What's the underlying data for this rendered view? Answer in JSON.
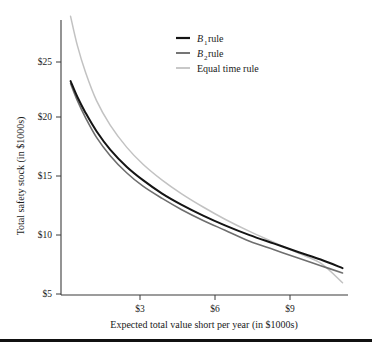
{
  "chart_data": {
    "type": "line",
    "title": "",
    "xlabel": "Expected total value short per year (in $1000s)",
    "ylabel": "Total safety stock (in $1000s)",
    "xlim": [
      1.0,
      11.5
    ],
    "ylim": [
      5,
      27.5
    ],
    "xticks": [
      3,
      6,
      9
    ],
    "xtick_labels": [
      "$3",
      "$6",
      "$9"
    ],
    "yticks": [
      5,
      10,
      15,
      20,
      25
    ],
    "ytick_labels": [
      "$5",
      "$10",
      "$15",
      "$20",
      "$25"
    ],
    "grid": false,
    "legend_position": "top-center-right",
    "series": [
      {
        "name": "B1 rule",
        "label_main": "B",
        "label_sub": "1",
        "label_tail": " rule",
        "color": "#141414",
        "width": 2.0,
        "x": [
          1.35,
          1.6,
          1.9,
          2.3,
          2.8,
          3.4,
          4.0,
          4.7,
          5.4,
          6.2,
          7.0,
          7.9,
          8.8,
          9.7,
          10.5,
          11.3
        ],
        "y": [
          22.5,
          21.2,
          19.9,
          18.4,
          16.9,
          15.5,
          14.4,
          13.3,
          12.4,
          11.5,
          10.7,
          9.9,
          9.2,
          8.5,
          7.9,
          7.2
        ]
      },
      {
        "name": "B2 rule",
        "label_main": "B",
        "label_sub": "2",
        "label_tail": " rule",
        "color": "#6e6e6e",
        "width": 1.6,
        "x": [
          1.35,
          1.6,
          1.9,
          2.3,
          2.8,
          3.4,
          4.0,
          4.7,
          5.4,
          6.2,
          7.0,
          7.9,
          8.8,
          9.7,
          10.5,
          11.3
        ],
        "y": [
          22.3,
          20.9,
          19.5,
          17.9,
          16.4,
          15.0,
          13.9,
          12.9,
          12.0,
          11.1,
          10.3,
          9.4,
          8.7,
          8.0,
          7.4,
          6.8
        ]
      },
      {
        "name": "Equal time rule",
        "label_main": "Equal time rule",
        "label_sub": "",
        "label_tail": "",
        "color": "#c2c2c2",
        "width": 1.5,
        "x": [
          1.35,
          1.6,
          1.9,
          2.3,
          2.8,
          3.4,
          4.0,
          4.7,
          5.4,
          6.2,
          7.0,
          7.9,
          8.8,
          9.7,
          10.5,
          11.3
        ],
        "y": [
          27.8,
          25.4,
          23.2,
          20.9,
          18.9,
          17.1,
          15.7,
          14.4,
          13.3,
          12.2,
          11.2,
          10.2,
          9.3,
          8.4,
          7.6,
          6.0
        ]
      }
    ],
    "legend_entries": [
      {
        "main": "B",
        "sub": "1",
        "tail": " rule",
        "color": "#141414"
      },
      {
        "main": "B",
        "sub": "2",
        "tail": " rule",
        "color": "#6e6e6e"
      },
      {
        "main": "Equal time rule",
        "sub": "",
        "tail": "",
        "color": "#c2c2c2"
      }
    ]
  },
  "axes": {
    "ytick_0": "$5",
    "ytick_1": "$10",
    "ytick_2": "$15",
    "ytick_3": "$20",
    "ytick_4": "$25",
    "xtick_0": "$3",
    "xtick_1": "$6",
    "xtick_2": "$9",
    "x_title": "Expected total value short per year (in $1000s)",
    "y_title": "Total safety stock (in $1000s)"
  },
  "legend": {
    "item_0_main": "B",
    "item_0_sub": "1",
    "item_0_tail": " rule",
    "item_1_main": "B",
    "item_1_sub": "2",
    "item_1_tail": " rule",
    "item_2_main": "Equal time rule"
  }
}
